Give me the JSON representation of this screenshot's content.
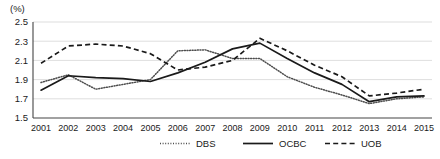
{
  "chart_data": {
    "type": "line",
    "title": "",
    "subtitle": "",
    "unit_label": "(%)",
    "xlabel": "",
    "ylabel": "",
    "categories": [
      "2001",
      "2002",
      "2003",
      "2004",
      "2005",
      "2006",
      "2007",
      "2008",
      "2009",
      "2010",
      "2011",
      "2012",
      "2013",
      "2014",
      "2015"
    ],
    "ylim": [
      1.5,
      2.5
    ],
    "yticks": [
      "1.5",
      "1.7",
      "1.9",
      "2.1",
      "2.3",
      "2.5"
    ],
    "ytick_values": [
      1.5,
      1.7,
      1.9,
      2.1,
      2.3,
      2.5
    ],
    "grid": true,
    "legend_position": "bottom",
    "series": [
      {
        "name": "DBS",
        "style": "dotted",
        "color": "#4d4d4d",
        "values": [
          1.87,
          1.95,
          1.8,
          1.85,
          1.9,
          2.2,
          2.21,
          2.12,
          2.12,
          1.93,
          1.82,
          1.74,
          1.65,
          1.7,
          1.72
        ]
      },
      {
        "name": "OCBC",
        "style": "solid",
        "color": "#1a1a1a",
        "values": [
          1.79,
          1.94,
          1.92,
          1.91,
          1.88,
          1.97,
          2.08,
          2.22,
          2.28,
          2.12,
          1.97,
          1.85,
          1.67,
          1.72,
          1.73
        ]
      },
      {
        "name": "UOB",
        "style": "dashed",
        "color": "#1a1a1a",
        "values": [
          2.07,
          2.25,
          2.27,
          2.25,
          2.17,
          2.0,
          2.03,
          2.1,
          2.33,
          2.2,
          2.05,
          1.93,
          1.73,
          1.76,
          1.8
        ]
      }
    ]
  },
  "legend": {
    "items": [
      {
        "label": "DBS"
      },
      {
        "label": "OCBC"
      },
      {
        "label": "UOB"
      }
    ]
  }
}
